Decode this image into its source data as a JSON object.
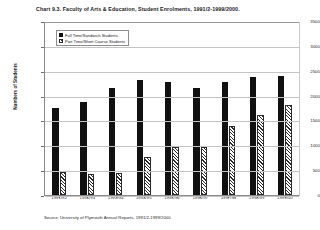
{
  "chart_data": {
    "type": "bar",
    "title": "Chart 9.3. Faculty of Arts & Education, Student Enrolments, 1991/2-1999/2000.",
    "xlabel": "",
    "ylabel": "Numbers of Students",
    "ylim": [
      0,
      3500
    ],
    "ytick_step": 500,
    "yticks": [
      "3500",
      "3000",
      "2500",
      "2000",
      "1500",
      "1000",
      "500",
      "0"
    ],
    "ytick_values": [
      3500,
      3000,
      2500,
      2000,
      1500,
      1000,
      500,
      0
    ],
    "grid": true,
    "legend_position": "top-left",
    "categories": [
      "1991/92",
      "1992/93",
      "1993/94",
      "1994/95",
      "1995/96",
      "1996/97",
      "1997/98",
      "1998/99",
      "1999/00"
    ],
    "series": [
      {
        "name": "Full Time/Sandwich Students",
        "color": "#111111",
        "values": [
          1750,
          1870,
          2160,
          2320,
          2280,
          2150,
          2270,
          2380,
          2400
        ]
      },
      {
        "name": "Part Time/Short Course Students",
        "color": "#ffffff",
        "values": [
          460,
          430,
          440,
          760,
          970,
          960,
          1390,
          1610,
          1810
        ]
      }
    ],
    "source": "Source: University of Plymouth Annual Reports, 1991/2-1999/2000"
  }
}
